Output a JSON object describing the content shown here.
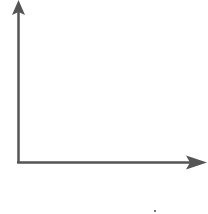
{
  "diagram": {
    "type": "blank-axes",
    "axis_color": "#555555",
    "x_axis": {
      "label": "",
      "direction": "right"
    },
    "y_axis": {
      "label": "",
      "direction": "up"
    },
    "origin_px": [
      18,
      163
    ]
  }
}
